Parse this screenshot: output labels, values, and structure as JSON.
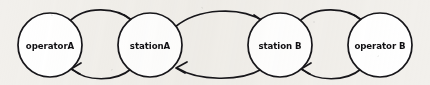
{
  "diagram": {
    "type": "state-transition-diagram",
    "style": "hand-drawn-scan",
    "background_color": "#f2f0ec",
    "ink_color": "#17161a",
    "node_fill_color": "#ffffff",
    "nodes": [
      {
        "id": "operatorA",
        "label": "operatorA",
        "cx": 50,
        "cy": 45,
        "r": 32
      },
      {
        "id": "stationA",
        "label": "stationA",
        "cx": 150,
        "cy": 45,
        "r": 32
      },
      {
        "id": "stationB",
        "label": "station B",
        "cx": 280,
        "cy": 45,
        "r": 32
      },
      {
        "id": "operatorB",
        "label": "operator B",
        "cx": 380,
        "cy": 45,
        "r": 32
      }
    ],
    "edges": [
      {
        "id": "e1",
        "from": "operatorA",
        "to": "stationA",
        "direction": "forward",
        "curve": "arc-above",
        "arrowhead": "open-v"
      },
      {
        "id": "e2",
        "from": "stationA",
        "to": "operatorA",
        "direction": "return",
        "curve": "arc-below",
        "arrowhead": "open-v"
      },
      {
        "id": "e3",
        "from": "stationA",
        "to": "stationB",
        "direction": "forward",
        "curve": "arc-above",
        "arrowhead": "open-v"
      },
      {
        "id": "e4",
        "from": "stationB",
        "to": "stationA",
        "direction": "return",
        "curve": "arc-below",
        "arrowhead": "open-v"
      },
      {
        "id": "e5",
        "from": "stationB",
        "to": "operatorB",
        "direction": "forward",
        "curve": "arc-above",
        "arrowhead": "open-v"
      },
      {
        "id": "e6",
        "from": "operatorB",
        "to": "stationB",
        "direction": "return",
        "curve": "arc-below",
        "arrowhead": "open-v"
      }
    ]
  }
}
